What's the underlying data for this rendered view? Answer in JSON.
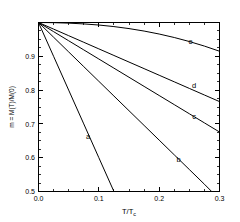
{
  "chart_data": {
    "type": "line",
    "title": "",
    "xlabel": "T/Tc",
    "xlabel_main": "T/T",
    "xlabel_sub": "c",
    "ylabel": "m = M(T)/M(0)",
    "xlim": [
      0.0,
      0.3
    ],
    "ylim": [
      0.5,
      1.0
    ],
    "xticks": [
      0.0,
      0.1,
      0.2,
      0.3
    ],
    "xticklabels": [
      "0.0",
      "0.1",
      "0.2",
      "0.3"
    ],
    "yticks": [
      0.5,
      0.6,
      0.7,
      0.8,
      0.9
    ],
    "yticklabels": [
      "0.5",
      "0.6",
      "0.7",
      "0.8",
      "0.9"
    ],
    "xminor_step": 0.025,
    "yminor_step": 0.025,
    "grid": false,
    "legend": "inline-curve-labels",
    "line_color": "#000000",
    "background_color": "#ffffff",
    "x": [
      0.0,
      0.025,
      0.05,
      0.075,
      0.1,
      0.125,
      0.15,
      0.175,
      0.2,
      0.225,
      0.25,
      0.275,
      0.3
    ],
    "series": [
      {
        "name": "a",
        "label": "a",
        "label_x": 0.082,
        "label_y": 0.656,
        "values": [
          1.0,
          0.9,
          0.8,
          0.7,
          0.6,
          0.5,
          null,
          null,
          null,
          null,
          null,
          null,
          null
        ],
        "ends_at_bottom_x": 0.125
      },
      {
        "name": "b",
        "label": "b",
        "label_x": 0.232,
        "label_y": 0.587,
        "values": [
          1.0,
          0.9565,
          0.913,
          0.8695,
          0.826,
          0.7825,
          0.739,
          0.6955,
          0.652,
          0.6085,
          0.565,
          0.5215,
          null
        ],
        "ends_at_bottom_x": 0.287
      },
      {
        "name": "c",
        "label": "c",
        "label_x": 0.258,
        "label_y": 0.714,
        "values": [
          1.0,
          0.973,
          0.946,
          0.919,
          0.892,
          0.865,
          0.838,
          0.811,
          0.784,
          0.757,
          0.73,
          0.703,
          0.676
        ]
      },
      {
        "name": "d",
        "label": "d",
        "label_x": 0.258,
        "label_y": 0.805,
        "values": [
          1.0,
          0.9805,
          0.961,
          0.9415,
          0.922,
          0.9025,
          0.883,
          0.8635,
          0.844,
          0.8245,
          0.805,
          0.7855,
          0.766
        ]
      },
      {
        "name": "e",
        "label": "e",
        "label_x": 0.252,
        "label_y": 0.937,
        "values": [
          1.0,
          0.9995,
          0.9981,
          0.9958,
          0.9925,
          0.9879,
          0.982,
          0.9747,
          0.9659,
          0.9556,
          0.9437,
          0.9302,
          0.915
        ]
      }
    ]
  }
}
